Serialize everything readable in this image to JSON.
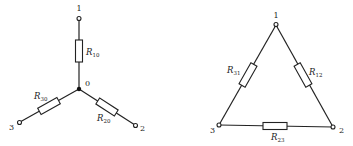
{
  "star": {
    "center_label": "0",
    "nodes": [
      {
        "id": "1",
        "label": "1"
      },
      {
        "id": "2",
        "label": "2"
      },
      {
        "id": "3",
        "label": "3"
      }
    ],
    "resistors": [
      {
        "id": "R10",
        "symbol": "R",
        "subscript": "10"
      },
      {
        "id": "R20",
        "symbol": "R",
        "subscript": "20"
      },
      {
        "id": "R30",
        "symbol": "R",
        "subscript": "30"
      }
    ]
  },
  "delta": {
    "nodes": [
      {
        "id": "1",
        "label": "1"
      },
      {
        "id": "2",
        "label": "2"
      },
      {
        "id": "3",
        "label": "3"
      }
    ],
    "resistors": [
      {
        "id": "R12",
        "symbol": "R",
        "subscript": "12"
      },
      {
        "id": "R23",
        "symbol": "R",
        "subscript": "23"
      },
      {
        "id": "R31",
        "symbol": "R",
        "subscript": "31"
      }
    ]
  }
}
